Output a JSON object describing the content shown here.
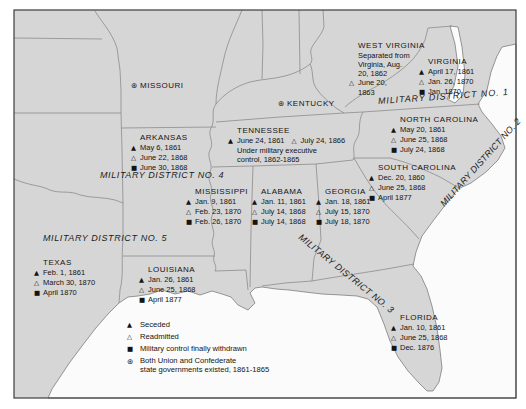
{
  "colors": {
    "land": "#d6d6d6",
    "water": "#fbfbfb",
    "border_line": "#8c8c8c",
    "frame": "#3c3c3c",
    "text": "#141414"
  },
  "symbols": {
    "seceded": "▲",
    "readmitted": "△",
    "withdrawn": "■",
    "both": "⊛"
  },
  "legend": {
    "items": [
      {
        "sym": "seceded",
        "lines": [
          "Seceded"
        ]
      },
      {
        "sym": "readmitted",
        "lines": [
          "Readmitted"
        ]
      },
      {
        "sym": "withdrawn",
        "lines": [
          "Military control finally withdrawn"
        ]
      },
      {
        "sym": "both",
        "lines": [
          "Both Union and Confederate",
          "state governments existed, 1861-1865"
        ]
      }
    ]
  },
  "districts": [
    {
      "label": "MILITARY DISTRICT NO. 1",
      "x": 378,
      "y": 96,
      "rotate": -4,
      "ls": 0.9
    },
    {
      "label": "MILITARY DISTRICT NO. 2",
      "x": 442,
      "y": 200,
      "rotate": -48,
      "ls": 0.2
    },
    {
      "label": "MILITARY DISTRICT NO. 3",
      "x": 300,
      "y": 231,
      "rotate": 39,
      "ls": 0.4
    },
    {
      "label": "MILITARY DISTRICT NO. 4",
      "x": 100,
      "y": 170,
      "rotate": 0,
      "ls": 0.6
    },
    {
      "label": "MILITARY DISTRICT NO. 5",
      "x": 43,
      "y": 233,
      "rotate": 0,
      "ls": 0.6
    }
  ],
  "states": [
    {
      "id": "missouri",
      "name": "MISSOURI",
      "name_sym": "both",
      "x": 131,
      "y": 81,
      "lines": []
    },
    {
      "id": "kentucky",
      "name": "KENTUCKY",
      "name_sym": "both",
      "x": 278,
      "y": 99,
      "lines": []
    },
    {
      "id": "west-virginia",
      "name": "WEST VIRGINIA",
      "x": 349,
      "y": 41,
      "lines": [
        [
          {
            "t": "Separated from"
          }
        ],
        [
          {
            "t": "Virginia, Aug."
          }
        ],
        [
          {
            "t": "20, 1862"
          }
        ],
        [
          {
            "s": "readmitted",
            "t": "June 20,"
          }
        ],
        [
          {
            "t": "1863"
          }
        ]
      ]
    },
    {
      "id": "virginia",
      "name": "VIRGINIA",
      "x": 419,
      "y": 57,
      "lines": [
        [
          {
            "s": "seceded",
            "t": "April 17, 1861"
          }
        ],
        [
          {
            "s": "readmitted",
            "t": "Jan. 26, 1870"
          }
        ],
        [
          {
            "s": "withdrawn",
            "t": "Jan. 1870"
          }
        ]
      ]
    },
    {
      "id": "north-carolina",
      "name": "NORTH CAROLINA",
      "x": 391,
      "y": 115,
      "lines": [
        [
          {
            "s": "seceded",
            "t": "May 20, 1861"
          }
        ],
        [
          {
            "s": "readmitted",
            "t": "June 25, 1868"
          }
        ],
        [
          {
            "s": "withdrawn",
            "t": "July 24, 1868"
          }
        ]
      ]
    },
    {
      "id": "tennessee",
      "name": "TENNESSEE",
      "x": 228,
      "y": 126,
      "lines": [
        [
          {
            "s": "seceded",
            "t": "June 24, 1861"
          },
          {
            "s": "readmitted",
            "t": "July 24, 1866"
          }
        ],
        [
          {
            "t": "Under military executive"
          }
        ],
        [
          {
            "t": "control, 1862-1865"
          }
        ]
      ]
    },
    {
      "id": "arkansas",
      "name": "ARKANSAS",
      "x": 131,
      "y": 133,
      "lines": [
        [
          {
            "s": "seceded",
            "t": "May 6, 1861"
          }
        ],
        [
          {
            "s": "readmitted",
            "t": "June 22, 1868"
          }
        ],
        [
          {
            "s": "withdrawn",
            "t": "June 30, 1868"
          }
        ]
      ]
    },
    {
      "id": "south-carolina",
      "name": "SOUTH CAROLINA",
      "x": 369,
      "y": 163,
      "lines": [
        [
          {
            "s": "seceded",
            "t": "Dec. 20, 1860"
          }
        ],
        [
          {
            "s": "readmitted",
            "t": "June 25, 1868"
          }
        ],
        [
          {
            "s": "withdrawn",
            "t": "April 1877"
          }
        ]
      ]
    },
    {
      "id": "mississippi",
      "name": "MISSISSIPPI",
      "x": 186,
      "y": 187,
      "lines": [
        [
          {
            "s": "seceded",
            "t": "Jan. 9, 1861"
          }
        ],
        [
          {
            "s": "readmitted",
            "t": "Feb. 23, 1870"
          }
        ],
        [
          {
            "s": "withdrawn",
            "t": "Feb. 26, 1870"
          }
        ]
      ]
    },
    {
      "id": "alabama",
      "name": "ALABAMA",
      "x": 252,
      "y": 187,
      "lines": [
        [
          {
            "s": "seceded",
            "t": "Jan. 11, 1861"
          }
        ],
        [
          {
            "s": "readmitted",
            "t": "July 14, 1868"
          }
        ],
        [
          {
            "s": "withdrawn",
            "t": "July 14, 1868"
          }
        ]
      ]
    },
    {
      "id": "georgia",
      "name": "GEORGIA",
      "x": 316,
      "y": 187,
      "lines": [
        [
          {
            "s": "seceded",
            "t": "Jan. 18, 1861"
          }
        ],
        [
          {
            "s": "readmitted",
            "t": "July 15, 1870"
          }
        ],
        [
          {
            "s": "withdrawn",
            "t": "July 18, 1870"
          }
        ]
      ]
    },
    {
      "id": "texas",
      "name": "TEXAS",
      "x": 34,
      "y": 258,
      "lines": [
        [
          {
            "s": "seceded",
            "t": "Feb. 1, 1861"
          }
        ],
        [
          {
            "s": "readmitted",
            "t": "March 30, 1870"
          }
        ],
        [
          {
            "s": "withdrawn",
            "t": "April 1870"
          }
        ]
      ]
    },
    {
      "id": "louisiana",
      "name": "LOUISIANA",
      "x": 139,
      "y": 265,
      "lines": [
        [
          {
            "s": "seceded",
            "t": "Jan. 26, 1861"
          }
        ],
        [
          {
            "s": "readmitted",
            "t": "June 25, 1868"
          }
        ],
        [
          {
            "s": "withdrawn",
            "t": "April 1877"
          }
        ]
      ]
    },
    {
      "id": "florida",
      "name": "FLORIDA",
      "x": 391,
      "y": 313,
      "lines": [
        [
          {
            "s": "seceded",
            "t": "Jan. 10, 1861"
          }
        ],
        [
          {
            "s": "readmitted",
            "t": "June 25, 1868"
          }
        ],
        [
          {
            "s": "withdrawn",
            "t": "Dec. 1876"
          }
        ]
      ]
    }
  ]
}
